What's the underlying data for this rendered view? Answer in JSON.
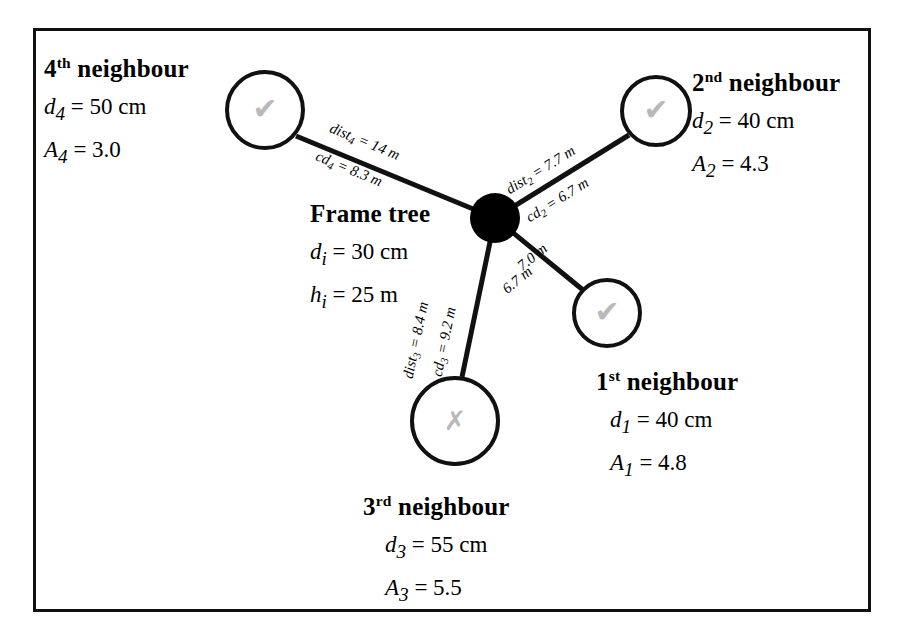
{
  "figure": {
    "title_present": false,
    "background": "#ffffff",
    "border_color": "#111111"
  },
  "center_node": {
    "name": "Frame tree",
    "marker": "filled-circle",
    "color": "#000000",
    "lines": [
      {
        "symbol": "d",
        "sub": "i",
        "value": "= 30 cm"
      },
      {
        "symbol": "h",
        "sub": "i",
        "value": "= 25 m"
      }
    ]
  },
  "neighbours": [
    {
      "id": "n1",
      "title_number": "1",
      "title_ordinal": "st",
      "title_rest": " neighbour",
      "mark": "check",
      "mark_glyph": "✔",
      "mark_color": "#b9b9b9",
      "lines": [
        {
          "symbol": "d",
          "sub": "1",
          "value": "= 40 cm"
        },
        {
          "symbol": "A",
          "sub": "1",
          "value": "= 4.8"
        }
      ],
      "edge_labels": {
        "dist": "7.0 m",
        "cd": "6.7 m"
      }
    },
    {
      "id": "n2",
      "title_number": "2",
      "title_ordinal": "nd",
      "title_rest": " neighbour",
      "mark": "check",
      "mark_glyph": "✔",
      "mark_color": "#b9b9b9",
      "lines": [
        {
          "symbol": "d",
          "sub": "2",
          "value": "= 40 cm"
        },
        {
          "symbol": "A",
          "sub": "2",
          "value": "= 4.3"
        }
      ],
      "edge_labels": {
        "dist": "dist₂ = 7.7 m",
        "cd": "cd₂ = 6.7 m"
      }
    },
    {
      "id": "n3",
      "title_number": "3",
      "title_ordinal": "rd",
      "title_rest": " neighbour",
      "mark": "cross",
      "mark_glyph": "✗",
      "mark_color": "#8e8e8e",
      "lines": [
        {
          "symbol": "d",
          "sub": "3",
          "value": "= 55 cm"
        },
        {
          "symbol": "A",
          "sub": "3",
          "value": "= 5.5"
        }
      ],
      "edge_labels": {
        "dist": "dist₃ = 8.4 m",
        "cd": "cd₃ = 9.2 m"
      }
    },
    {
      "id": "n4",
      "title_number": "4",
      "title_ordinal": "th",
      "title_rest": " neighbour",
      "mark": "check",
      "mark_glyph": "✔",
      "mark_color": "#b9b9b9",
      "lines": [
        {
          "symbol": "d",
          "sub": "4",
          "value": "= 50 cm"
        },
        {
          "symbol": "A",
          "sub": "4",
          "value": "= 3.0"
        }
      ],
      "edge_labels": {
        "dist": "dist₄ = 14 m",
        "cd": "cd₄ = 8.3 m"
      }
    }
  ],
  "edge_label_parts": {
    "e1_dist": {
      "prefix": "",
      "sub": "",
      "value": "7.0 m"
    },
    "e1_cd": {
      "prefix": "",
      "sub": "",
      "value": "6.7 m"
    },
    "e2_dist": {
      "prefix": "dist",
      "sub": "2",
      "value": " = 7.7 m"
    },
    "e2_cd": {
      "prefix": "cd",
      "sub": "2",
      "value": " = 6.7 m"
    },
    "e3_dist": {
      "prefix": "dist",
      "sub": "3",
      "value": " = 8.4 m"
    },
    "e3_cd": {
      "prefix": "cd",
      "sub": "3",
      "value": " = 9.2 m"
    },
    "e4_dist": {
      "prefix": "dist",
      "sub": "4",
      "value": " = 14 m"
    },
    "e4_cd": {
      "prefix": "cd",
      "sub": "4",
      "value": " = 8.3 m"
    }
  }
}
